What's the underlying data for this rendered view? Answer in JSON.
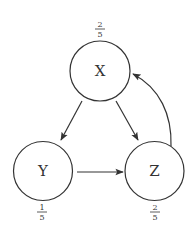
{
  "diagram": {
    "type": "directed-graph",
    "nodes": [
      {
        "id": "X",
        "label": "X",
        "weight_num": "2",
        "weight_den": "5",
        "weight_position": "above"
      },
      {
        "id": "Y",
        "label": "Y",
        "weight_num": "1",
        "weight_den": "5",
        "weight_position": "below"
      },
      {
        "id": "Z",
        "label": "Z",
        "weight_num": "2",
        "weight_den": "5",
        "weight_position": "below"
      }
    ],
    "edges": [
      {
        "from": "X",
        "to": "Y"
      },
      {
        "from": "X",
        "to": "Z"
      },
      {
        "from": "Y",
        "to": "Z"
      },
      {
        "from": "Z",
        "to": "X",
        "curved": true
      }
    ],
    "colors": {
      "stroke": "#333333",
      "background": "#ffffff"
    }
  }
}
